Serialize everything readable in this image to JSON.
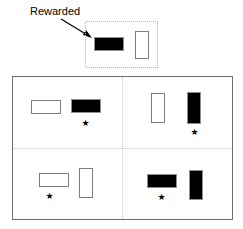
{
  "figure": {
    "background_color": "#ffffff",
    "annotation": {
      "label": "Rewarded",
      "arrow": "arrow-pointing-down-right",
      "points_to": "sample-black-horizontal-bar"
    },
    "sample_panel": {
      "name": "sample-display",
      "border_style": "dotted",
      "border_color": "#b4b4b4",
      "items": [
        {
          "id": "sample-black-horizontal",
          "fill": "#000000",
          "orientation": "horizontal",
          "rewarded": true,
          "x": 8,
          "y": 15,
          "w": 30,
          "h": 14
        },
        {
          "id": "sample-white-vertical",
          "fill": "#ffffff",
          "orientation": "vertical",
          "rewarded": false,
          "x": 49,
          "y": 9,
          "w": 14,
          "h": 28
        }
      ]
    },
    "arena": {
      "name": "choice-arena",
      "border_color": "#6e6e6e",
      "divider_color": "#c8c8c8",
      "quadrants": [
        {
          "id": "quadrant-top-left",
          "items": [
            {
              "id": "tl-white-horizontal",
              "fill": "#ffffff",
              "orientation": "horizontal",
              "correct": false,
              "x": 18,
              "y": 23,
              "w": 30,
              "h": 14
            },
            {
              "id": "tl-black-horizontal",
              "fill": "#000000",
              "orientation": "horizontal",
              "correct": true,
              "x": 58,
              "y": 22,
              "w": 30,
              "h": 14
            }
          ],
          "star": {
            "id": "tl-star",
            "glyph": "★",
            "x": 68,
            "y": 42
          }
        },
        {
          "id": "quadrant-top-right",
          "items": [
            {
              "id": "tr-white-vertical",
              "fill": "#ffffff",
              "orientation": "vertical",
              "correct": false,
              "x": 138,
              "y": 16,
              "w": 14,
              "h": 30
            },
            {
              "id": "tr-black-vertical",
              "fill": "#000000",
              "orientation": "vertical",
              "correct": true,
              "x": 174,
              "y": 15,
              "w": 14,
              "h": 32
            }
          ],
          "star": {
            "id": "tr-star",
            "glyph": "★",
            "x": 177,
            "y": 51
          }
        },
        {
          "id": "quadrant-bottom-left",
          "items": [
            {
              "id": "bl-white-horizontal",
              "fill": "#ffffff",
              "orientation": "horizontal",
              "correct": true,
              "x": 26,
              "y": 96,
              "w": 30,
              "h": 14
            },
            {
              "id": "bl-white-vertical",
              "fill": "#ffffff",
              "orientation": "vertical",
              "correct": false,
              "x": 66,
              "y": 91,
              "w": 14,
              "h": 30
            }
          ],
          "star": {
            "id": "bl-star",
            "glyph": "★",
            "x": 32,
            "y": 115
          }
        },
        {
          "id": "quadrant-bottom-right",
          "items": [
            {
              "id": "br-black-horizontal",
              "fill": "#000000",
              "orientation": "horizontal",
              "correct": true,
              "x": 134,
              "y": 97,
              "w": 30,
              "h": 14
            },
            {
              "id": "br-black-vertical",
              "fill": "#000000",
              "orientation": "vertical",
              "correct": false,
              "x": 176,
              "y": 93,
              "w": 14,
              "h": 30
            }
          ],
          "star": {
            "id": "br-star",
            "glyph": "★",
            "x": 144,
            "y": 116
          }
        }
      ]
    }
  }
}
